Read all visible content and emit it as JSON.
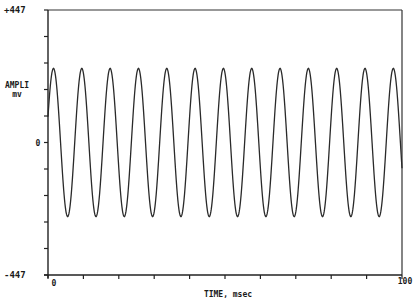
{
  "chart_data": {
    "type": "line",
    "title": "",
    "xlabel": "TIME, msec",
    "ylabel": "AMPLI",
    "ylabel_unit": "mv",
    "xlim": [
      0,
      100
    ],
    "ylim": [
      -447,
      447
    ],
    "x_tick_labels": [
      "0",
      "100"
    ],
    "y_tick_labels": [
      "+447",
      "0",
      "-447"
    ],
    "x_minor_ticks": 10,
    "y_minor_ticks": 10,
    "grid": false,
    "legend": null,
    "series": [
      {
        "name": "signal",
        "waveform": "sine",
        "amplitude": 250,
        "offset": 0,
        "period_msec": 8.0,
        "frequency_hz": 125,
        "cycles": 12.5,
        "phase_start_value": 87,
        "peaks_visible": 13,
        "color": "#2a2a2a"
      }
    ]
  },
  "labels": {
    "y_top": "+447",
    "y_zero": "0",
    "y_bottom": "-447",
    "y_name": "AMPLI",
    "y_unit": "mv",
    "x_start": "0",
    "x_end": "100",
    "x_name": "TIME, msec"
  }
}
